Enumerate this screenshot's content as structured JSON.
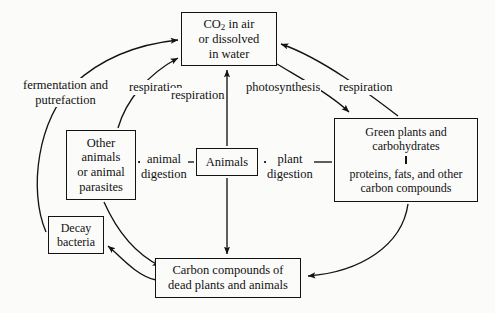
{
  "diagram": {
    "background_color": "#fbfbfa",
    "line_color": "#131313",
    "boxes": {
      "co2": {
        "line1": "CO",
        "sub1": "2",
        "line1b": " in air",
        "line2": "or dissolved",
        "line3": "in water"
      },
      "other_animals": {
        "line1": "Other",
        "line2": "animals",
        "line3": "or animal",
        "line4": "parasites"
      },
      "animals": {
        "line1": "Animals"
      },
      "green_plants": {
        "line1": "Green plants and",
        "line2": "carbohydrates",
        "line3": "proteins, fats, and other",
        "line4": "carbon compounds"
      },
      "decay_bacteria": {
        "line1": "Decay",
        "line2": "bacteria"
      },
      "dead_matter": {
        "line1": "Carbon compounds of",
        "line2": "dead plants and animals"
      }
    },
    "labels": {
      "fermentation": {
        "line1": "fermentation and",
        "line2": "putrefaction"
      },
      "respiration_left": "respiration",
      "respiration_middle": "respiration",
      "respiration_right": "respiration",
      "photosynthesis": "photosynthesis",
      "animal_digestion": {
        "line1": "animal",
        "line2": "digestion"
      },
      "plant_digestion": {
        "line1": "plant",
        "line2": "digestion"
      }
    }
  }
}
